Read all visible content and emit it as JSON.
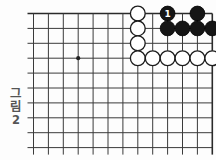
{
  "figure": {
    "caption_korean": "그림",
    "caption_number": "2",
    "caption_full": "그림 2"
  },
  "board": {
    "type": "go-board-diagram",
    "game": "Go / Baduk",
    "columns": 13,
    "rows": 10,
    "shows_top_edge": true,
    "shows_right_edge": true,
    "shows_left_edge": false,
    "shows_bottom_edge": false,
    "line_color": "#3a3a3a",
    "edge_color": "#2a2a2a",
    "background_color": "#fdfdfd",
    "star_points": [
      {
        "col": 4,
        "row": 4
      }
    ]
  },
  "stones": {
    "white_color": "#ffffff",
    "black_color": "#151515",
    "white": [
      {
        "col": 8,
        "row": 1
      },
      {
        "col": 8,
        "row": 2
      },
      {
        "col": 8,
        "row": 3
      },
      {
        "col": 8,
        "row": 4
      },
      {
        "col": 9,
        "row": 4
      },
      {
        "col": 10,
        "row": 4
      },
      {
        "col": 11,
        "row": 4
      },
      {
        "col": 12,
        "row": 4
      },
      {
        "col": 13,
        "row": 4
      }
    ],
    "black": [
      {
        "col": 10,
        "row": 1,
        "label": "1"
      },
      {
        "col": 12,
        "row": 1
      },
      {
        "col": 10,
        "row": 2
      },
      {
        "col": 11,
        "row": 2
      },
      {
        "col": 12,
        "row": 2
      },
      {
        "col": 13,
        "row": 2
      }
    ]
  },
  "moves": [
    {
      "number": "1",
      "color": "black",
      "col": 10,
      "row": 1
    }
  ],
  "counts": {
    "white_stones": "9",
    "black_stones": "6",
    "numbered_moves": "1"
  }
}
